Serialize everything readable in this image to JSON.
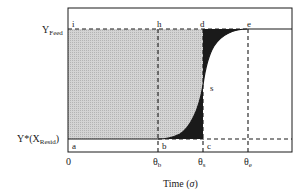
{
  "diagram": {
    "type": "breakthrough-curve",
    "y_axis": {
      "top_label": "Y",
      "top_label_sub": "Feed",
      "bottom_label": "Y*(X",
      "bottom_label_sub": "Resid",
      "bottom_label_close": ")"
    },
    "x_axis": {
      "origin": "0",
      "ticks": [
        {
          "name": "theta-b",
          "sym": "θ",
          "sub": "b"
        },
        {
          "name": "theta-s",
          "sym": "θ",
          "sub": "s"
        },
        {
          "name": "theta-e",
          "sym": "θ",
          "sub": "e"
        }
      ],
      "title": "Time (",
      "title_var": "σ",
      "title_close": ")"
    },
    "points": {
      "a": "a",
      "b": "b",
      "c": "c",
      "d": "d",
      "e": "e",
      "h": "h",
      "i": "i",
      "s": "s"
    },
    "colors": {
      "frame": "#1a1a1a",
      "light_fill": "#c8c8c8",
      "dark_fill": "#1a1a1a",
      "background": "#ffffff"
    }
  }
}
